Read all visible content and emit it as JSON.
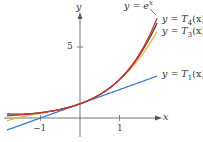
{
  "chart_data": {
    "type": "line",
    "title": "",
    "xlabel": "x",
    "ylabel": "y",
    "xlim": [
      -2,
      2
    ],
    "ylim": [
      -1,
      7.5
    ],
    "x_ticks": [
      {
        "value": -1,
        "label": "−1"
      },
      {
        "value": 1,
        "label": "1"
      }
    ],
    "y_ticks": [
      {
        "value": 5,
        "label": "5"
      }
    ],
    "grid": false,
    "legend": "inline labels",
    "x_range": [
      -1.85,
      1.95
    ],
    "series": [
      {
        "name": "y = e^x",
        "label_main": "y = e",
        "label_sup": "x",
        "color": "#c9333a",
        "fn": "exp"
      },
      {
        "name": "y = T4(x)",
        "label_main": "y = T",
        "label_sub": "4",
        "label_tail": "(x)",
        "color": "#5a3a2a",
        "fn": "T4"
      },
      {
        "name": "y = T3(x)",
        "label_main": "y = T",
        "label_sub": "3",
        "label_tail": "(x)",
        "color": "#eeb040",
        "fn": "T3"
      },
      {
        "name": "y = T1(x)",
        "label_main": "y = T",
        "label_sub": "1",
        "label_tail": "(x)",
        "color": "#3f7ccc",
        "fn": "T1"
      }
    ]
  },
  "axes": {
    "x_label": "x",
    "y_label": "y"
  }
}
